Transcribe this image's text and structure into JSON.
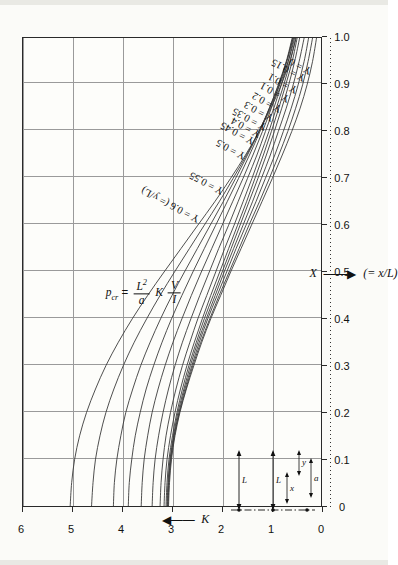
{
  "chart_data": {
    "type": "line",
    "title": "",
    "xlabel": "X  (= x/L)",
    "ylabel": "K",
    "xlim": [
      0,
      1.0
    ],
    "ylim": [
      0,
      6
    ],
    "xticks": [
      "0",
      "0.1",
      "0.2",
      "0.3",
      "0.4",
      "0.5",
      "0.6",
      "0.7",
      "0.8",
      "0.9",
      "1.0"
    ],
    "yticks": [
      "0",
      "1",
      "2",
      "3",
      "4",
      "5",
      "6"
    ],
    "grid": true,
    "legend_position": "inline-curve-labels",
    "orientation": "page-rotated-90-ccw",
    "series": [
      {
        "name": "Y = 0.6 (= y/L)",
        "points": [
          [
            0.0,
            5.05
          ],
          [
            0.05,
            5.02
          ],
          [
            0.1,
            4.96
          ],
          [
            0.15,
            4.86
          ],
          [
            0.2,
            4.72
          ],
          [
            0.25,
            4.54
          ],
          [
            0.3,
            4.33
          ],
          [
            0.35,
            4.08
          ],
          [
            0.4,
            3.8
          ],
          [
            0.45,
            3.49
          ],
          [
            0.5,
            3.16
          ],
          [
            0.55,
            2.82
          ],
          [
            0.6,
            2.48
          ],
          [
            0.65,
            2.14
          ],
          [
            0.7,
            1.82
          ],
          [
            0.75,
            1.52
          ],
          [
            0.8,
            1.25
          ],
          [
            0.85,
            1.01
          ],
          [
            0.9,
            0.8
          ],
          [
            0.95,
            0.63
          ],
          [
            1.0,
            0.5
          ]
        ]
      },
      {
        "name": "Y = 0.55",
        "points": [
          [
            0.0,
            4.62
          ],
          [
            0.05,
            4.59
          ],
          [
            0.1,
            4.54
          ],
          [
            0.15,
            4.45
          ],
          [
            0.2,
            4.33
          ],
          [
            0.25,
            4.17
          ],
          [
            0.3,
            3.98
          ],
          [
            0.35,
            3.76
          ],
          [
            0.4,
            3.51
          ],
          [
            0.45,
            3.24
          ],
          [
            0.5,
            2.95
          ],
          [
            0.55,
            2.65
          ],
          [
            0.6,
            2.35
          ],
          [
            0.65,
            2.05
          ],
          [
            0.7,
            1.77
          ],
          [
            0.75,
            1.5
          ],
          [
            0.8,
            1.25
          ],
          [
            0.85,
            1.03
          ],
          [
            0.9,
            0.83
          ],
          [
            0.95,
            0.66
          ],
          [
            1.0,
            0.53
          ]
        ]
      },
      {
        "name": "Y = 0.5",
        "points": [
          [
            0.0,
            4.18
          ],
          [
            0.05,
            4.16
          ],
          [
            0.1,
            4.11
          ],
          [
            0.15,
            4.03
          ],
          [
            0.2,
            3.93
          ],
          [
            0.25,
            3.79
          ],
          [
            0.3,
            3.63
          ],
          [
            0.35,
            3.44
          ],
          [
            0.4,
            3.23
          ],
          [
            0.45,
            3.0
          ],
          [
            0.5,
            2.75
          ],
          [
            0.55,
            2.49
          ],
          [
            0.6,
            2.23
          ],
          [
            0.65,
            1.97
          ],
          [
            0.7,
            1.72
          ],
          [
            0.75,
            1.48
          ],
          [
            0.8,
            1.25
          ],
          [
            0.85,
            1.04
          ],
          [
            0.9,
            0.85
          ],
          [
            0.95,
            0.69
          ],
          [
            1.0,
            0.56
          ]
        ]
      },
      {
        "name": "Y = 0.45",
        "points": [
          [
            0.0,
            3.88
          ],
          [
            0.05,
            3.86
          ],
          [
            0.1,
            3.81
          ],
          [
            0.15,
            3.74
          ],
          [
            0.2,
            3.64
          ],
          [
            0.25,
            3.52
          ],
          [
            0.3,
            3.37
          ],
          [
            0.35,
            3.2
          ],
          [
            0.4,
            3.01
          ],
          [
            0.45,
            2.8
          ],
          [
            0.5,
            2.58
          ],
          [
            0.55,
            2.35
          ],
          [
            0.6,
            2.12
          ],
          [
            0.65,
            1.89
          ],
          [
            0.7,
            1.66
          ],
          [
            0.75,
            1.44
          ],
          [
            0.8,
            1.23
          ],
          [
            0.85,
            1.04
          ],
          [
            0.9,
            0.86
          ],
          [
            0.95,
            0.7
          ],
          [
            1.0,
            0.58
          ]
        ]
      },
      {
        "name": "Y = 0.4",
        "points": [
          [
            0.0,
            3.62
          ],
          [
            0.05,
            3.6
          ],
          [
            0.1,
            3.56
          ],
          [
            0.15,
            3.49
          ],
          [
            0.2,
            3.4
          ],
          [
            0.25,
            3.28
          ],
          [
            0.3,
            3.14
          ],
          [
            0.35,
            2.98
          ],
          [
            0.4,
            2.8
          ],
          [
            0.45,
            2.61
          ],
          [
            0.5,
            2.41
          ],
          [
            0.55,
            2.2
          ],
          [
            0.6,
            1.99
          ],
          [
            0.65,
            1.78
          ],
          [
            0.7,
            1.57
          ],
          [
            0.75,
            1.37
          ],
          [
            0.8,
            1.18
          ],
          [
            0.85,
            1.0
          ],
          [
            0.9,
            0.84
          ],
          [
            0.95,
            0.69
          ],
          [
            1.0,
            0.57
          ]
        ]
      },
      {
        "name": "Y = 0.35",
        "points": [
          [
            0.0,
            3.4
          ],
          [
            0.05,
            3.38
          ],
          [
            0.1,
            3.34
          ],
          [
            0.15,
            3.27
          ],
          [
            0.2,
            3.18
          ],
          [
            0.25,
            3.07
          ],
          [
            0.3,
            2.94
          ],
          [
            0.35,
            2.79
          ],
          [
            0.4,
            2.62
          ],
          [
            0.45,
            2.44
          ],
          [
            0.5,
            2.25
          ],
          [
            0.55,
            2.06
          ],
          [
            0.6,
            1.86
          ],
          [
            0.65,
            1.67
          ],
          [
            0.7,
            1.48
          ],
          [
            0.75,
            1.29
          ],
          [
            0.8,
            1.12
          ],
          [
            0.85,
            0.95
          ],
          [
            0.9,
            0.8
          ],
          [
            0.95,
            0.66
          ],
          [
            1.0,
            0.55
          ]
        ]
      },
      {
        "name": "Y = 0.3",
        "points": [
          [
            0.0,
            3.24
          ],
          [
            0.05,
            3.22
          ],
          [
            0.1,
            3.18
          ],
          [
            0.15,
            3.12
          ],
          [
            0.2,
            3.03
          ],
          [
            0.25,
            2.92
          ],
          [
            0.3,
            2.79
          ],
          [
            0.35,
            2.64
          ],
          [
            0.4,
            2.48
          ],
          [
            0.45,
            2.3
          ],
          [
            0.5,
            2.12
          ],
          [
            0.55,
            1.94
          ],
          [
            0.6,
            1.75
          ],
          [
            0.65,
            1.57
          ],
          [
            0.7,
            1.39
          ],
          [
            0.75,
            1.22
          ],
          [
            0.8,
            1.05
          ],
          [
            0.85,
            0.9
          ],
          [
            0.9,
            0.75
          ],
          [
            0.95,
            0.62
          ],
          [
            1.0,
            0.51
          ]
        ]
      },
      {
        "name": "Y = 0.25",
        "points": [
          [
            0.0,
            3.16
          ],
          [
            0.05,
            3.14
          ],
          [
            0.1,
            3.1
          ],
          [
            0.15,
            3.03
          ],
          [
            0.2,
            2.94
          ],
          [
            0.25,
            2.83
          ],
          [
            0.3,
            2.7
          ],
          [
            0.35,
            2.55
          ],
          [
            0.4,
            2.39
          ],
          [
            0.45,
            2.22
          ],
          [
            0.5,
            2.04
          ],
          [
            0.55,
            1.86
          ],
          [
            0.6,
            1.68
          ],
          [
            0.65,
            1.5
          ],
          [
            0.7,
            1.33
          ],
          [
            0.75,
            1.16
          ],
          [
            0.8,
            1.0
          ],
          [
            0.85,
            0.85
          ],
          [
            0.9,
            0.71
          ],
          [
            0.95,
            0.58
          ],
          [
            1.0,
            0.48
          ]
        ]
      },
      {
        "name": "Y = 0.2",
        "points": [
          [
            0.0,
            3.12
          ],
          [
            0.05,
            3.1
          ],
          [
            0.1,
            3.06
          ],
          [
            0.15,
            2.99
          ],
          [
            0.2,
            2.9
          ],
          [
            0.25,
            2.79
          ],
          [
            0.3,
            2.66
          ],
          [
            0.35,
            2.51
          ],
          [
            0.4,
            2.35
          ],
          [
            0.45,
            2.17
          ],
          [
            0.5,
            1.99
          ],
          [
            0.55,
            1.81
          ],
          [
            0.6,
            1.63
          ],
          [
            0.65,
            1.45
          ],
          [
            0.7,
            1.27
          ],
          [
            0.75,
            1.1
          ],
          [
            0.8,
            0.94
          ],
          [
            0.85,
            0.79
          ],
          [
            0.9,
            0.65
          ],
          [
            0.95,
            0.53
          ],
          [
            1.0,
            0.43
          ]
        ]
      },
      {
        "name": "Y = 0.15",
        "points": [
          [
            0.0,
            3.1
          ],
          [
            0.05,
            3.08
          ],
          [
            0.1,
            3.04
          ],
          [
            0.15,
            2.97
          ],
          [
            0.2,
            2.88
          ],
          [
            0.25,
            2.76
          ],
          [
            0.3,
            2.63
          ],
          [
            0.35,
            2.48
          ],
          [
            0.4,
            2.31
          ],
          [
            0.45,
            2.13
          ],
          [
            0.5,
            1.95
          ],
          [
            0.55,
            1.76
          ],
          [
            0.6,
            1.57
          ],
          [
            0.65,
            1.38
          ],
          [
            0.7,
            1.2
          ],
          [
            0.75,
            1.02
          ],
          [
            0.8,
            0.86
          ],
          [
            0.85,
            0.7
          ],
          [
            0.9,
            0.56
          ],
          [
            0.95,
            0.44
          ],
          [
            1.0,
            0.34
          ]
        ]
      },
      {
        "name": "Y = 0.1",
        "points": [
          [
            0.0,
            3.09
          ],
          [
            0.05,
            3.07
          ],
          [
            0.1,
            3.03
          ],
          [
            0.15,
            2.96
          ],
          [
            0.2,
            2.86
          ],
          [
            0.25,
            2.74
          ],
          [
            0.3,
            2.6
          ],
          [
            0.35,
            2.45
          ],
          [
            0.4,
            2.28
          ],
          [
            0.45,
            2.09
          ],
          [
            0.5,
            1.9
          ],
          [
            0.55,
            1.71
          ],
          [
            0.6,
            1.51
          ],
          [
            0.65,
            1.31
          ],
          [
            0.7,
            1.12
          ],
          [
            0.75,
            0.93
          ],
          [
            0.8,
            0.76
          ],
          [
            0.85,
            0.6
          ],
          [
            0.9,
            0.46
          ],
          [
            0.95,
            0.34
          ],
          [
            1.0,
            0.25
          ]
        ]
      },
      {
        "name": "Y = 0.05",
        "points": [
          [
            0.0,
            3.08
          ],
          [
            0.05,
            3.06
          ],
          [
            0.1,
            3.02
          ],
          [
            0.15,
            2.95
          ],
          [
            0.2,
            2.85
          ],
          [
            0.25,
            2.72
          ],
          [
            0.3,
            2.58
          ],
          [
            0.35,
            2.42
          ],
          [
            0.4,
            2.24
          ],
          [
            0.45,
            2.05
          ],
          [
            0.5,
            1.85
          ],
          [
            0.55,
            1.65
          ],
          [
            0.6,
            1.45
          ],
          [
            0.65,
            1.24
          ],
          [
            0.7,
            1.04
          ],
          [
            0.75,
            0.85
          ],
          [
            0.8,
            0.67
          ],
          [
            0.85,
            0.51
          ],
          [
            0.9,
            0.37
          ],
          [
            0.95,
            0.26
          ],
          [
            1.0,
            0.17
          ]
        ]
      },
      {
        "name": "Y = 0",
        "points": [
          [
            0.0,
            3.07
          ],
          [
            0.05,
            3.05
          ],
          [
            0.1,
            3.01
          ],
          [
            0.15,
            2.94
          ],
          [
            0.2,
            2.84
          ],
          [
            0.25,
            2.71
          ],
          [
            0.3,
            2.56
          ],
          [
            0.35,
            2.4
          ],
          [
            0.4,
            2.22
          ],
          [
            0.45,
            2.02
          ],
          [
            0.5,
            1.82
          ],
          [
            0.55,
            1.61
          ],
          [
            0.6,
            1.4
          ],
          [
            0.65,
            1.19
          ],
          [
            0.7,
            0.98
          ],
          [
            0.75,
            0.78
          ],
          [
            0.8,
            0.59
          ],
          [
            0.85,
            0.42
          ],
          [
            0.9,
            0.28
          ],
          [
            0.95,
            0.17
          ],
          [
            1.0,
            0.09
          ]
        ]
      }
    ],
    "annotations": [
      "p_cr = (L^2 / a) K (V / I)",
      "Y = 0.6 (= y/L)",
      "X (= x/L)"
    ]
  },
  "axes": {
    "x": {
      "title_symbol": "X",
      "title_paren": "(= x/L)",
      "ticks": [
        "0",
        "0.1",
        "0.2",
        "0.3",
        "0.4",
        "0.5",
        "0.6",
        "0.7",
        "0.8",
        "0.9",
        "1.0"
      ]
    },
    "y": {
      "title_symbol": "K",
      "ticks": [
        "0",
        "1",
        "2",
        "3",
        "4",
        "5",
        "6"
      ]
    }
  },
  "formula": {
    "lhs": "p",
    "lhs_sub": "cr",
    "equals": "=",
    "frac1_num": "L",
    "frac1_num_sup": "2",
    "frac1_den": "a",
    "mid": "K",
    "frac2_num": "V",
    "frac2_den": "I"
  },
  "curve_labels": [
    {
      "text": "Y = 0.6  (= y/L)"
    },
    {
      "text": "Y = 0.55"
    },
    {
      "text": "Y = 0.5"
    },
    {
      "text": "Y = 0.45"
    },
    {
      "text": "Y = 0.4"
    },
    {
      "text": "Y = 0.35"
    },
    {
      "text": "Y = 0.3"
    },
    {
      "text": "Y = 0.2"
    },
    {
      "text": "Y = 0.1"
    },
    {
      "text": "Y = 0.1"
    },
    {
      "text": "Y = 0.15"
    },
    {
      "text": "Y = 0"
    }
  ],
  "inset": {
    "label_L_left": "L",
    "label_L_right": "L",
    "label_x": "x",
    "label_y": "y",
    "label_a": "a"
  }
}
